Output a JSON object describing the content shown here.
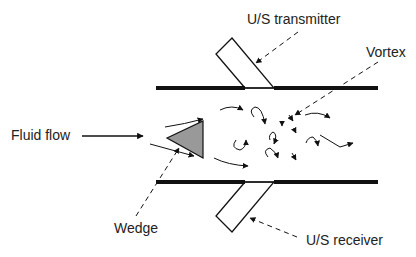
{
  "diagram": {
    "type": "vortex-flowmeter-schematic",
    "labels": {
      "transmitter": "U/S transmitter",
      "vortex": "Vortex",
      "fluid_flow": "Fluid flow",
      "wedge": "Wedge",
      "receiver": "U/S receiver"
    },
    "colors": {
      "line": "#111111",
      "wedge_fill": "#999999",
      "text": "#222222",
      "background": "#ffffff"
    }
  }
}
